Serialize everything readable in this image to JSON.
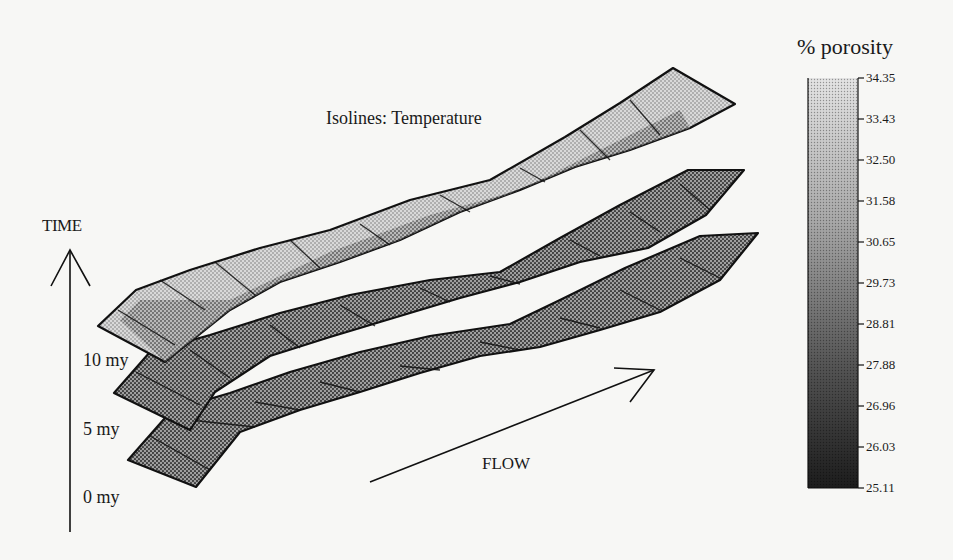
{
  "figure": {
    "title": "Isolines: Temperature",
    "time_axis": {
      "label": "TIME",
      "ticks": [
        {
          "label": "10 my"
        },
        {
          "label": "5 my"
        },
        {
          "label": "0 my"
        }
      ]
    },
    "flow_label": "FLOW",
    "sheets": [
      {
        "name": "0 my",
        "time": "0 my"
      },
      {
        "name": "5 my",
        "time": "5 my"
      },
      {
        "name": "10 my",
        "time": "10 my"
      }
    ],
    "colorbar": {
      "title": "% porosity",
      "ticks": [
        "34.35",
        "33.43",
        "32.50",
        "31.58",
        "30.65",
        "29.73",
        "28.81",
        "27.88",
        "26.96",
        "26.03",
        "25.11"
      ],
      "min": 25.11,
      "max": 34.35,
      "colors": {
        "light": "#e6e6e6",
        "dark": "#1e1e1e"
      }
    }
  }
}
